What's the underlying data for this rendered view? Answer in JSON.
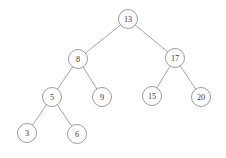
{
  "figure": {
    "background_color": "#ffffff",
    "node_stroke_color": "#8a8a8a",
    "node_fill_color": "#ffffff",
    "edge_color": "#8e8e8e",
    "label_color": "#3a3a3a",
    "node_radius": 9.5,
    "caption_ghost": ""
  },
  "chart_data": {
    "type": "diagram",
    "diagram_type": "binary-search-tree",
    "xlabel": "",
    "ylabel": "",
    "root": "n13",
    "depth": 4,
    "node_count": 9,
    "edge_count": 8,
    "traversal_inorder": [
      3,
      5,
      6,
      8,
      9,
      13,
      15,
      17,
      20
    ],
    "values": [
      13,
      8,
      17,
      5,
      9,
      15,
      20,
      3,
      6
    ],
    "nodes": [
      {
        "id": "n13",
        "label": "13",
        "value": 13,
        "x": 128,
        "y": 19,
        "level": 0,
        "parent": null,
        "side": "root"
      },
      {
        "id": "n8",
        "label": "8",
        "value": 8,
        "x": 78,
        "y": 59,
        "level": 1,
        "parent": "n13",
        "side": "left"
      },
      {
        "id": "n17",
        "label": "17",
        "value": 17,
        "x": 175,
        "y": 58,
        "level": 1,
        "parent": "n13",
        "side": "right"
      },
      {
        "id": "n5",
        "label": "5",
        "value": 5,
        "x": 52,
        "y": 97,
        "level": 2,
        "parent": "n8",
        "side": "left"
      },
      {
        "id": "n9",
        "label": "9",
        "value": 9,
        "x": 102,
        "y": 97,
        "level": 2,
        "parent": "n8",
        "side": "right"
      },
      {
        "id": "n15",
        "label": "15",
        "value": 15,
        "x": 152,
        "y": 96,
        "level": 2,
        "parent": "n17",
        "side": "left"
      },
      {
        "id": "n20",
        "label": "20",
        "value": 20,
        "x": 201,
        "y": 97,
        "level": 2,
        "parent": "n17",
        "side": "right"
      },
      {
        "id": "n3",
        "label": "3",
        "value": 3,
        "x": 27,
        "y": 133,
        "level": 3,
        "parent": "n5",
        "side": "left"
      },
      {
        "id": "n6",
        "label": "6",
        "value": 6,
        "x": 77,
        "y": 134,
        "level": 3,
        "parent": "n5",
        "side": "right"
      }
    ],
    "edges": [
      {
        "from": "n13",
        "to": "n8"
      },
      {
        "from": "n13",
        "to": "n17"
      },
      {
        "from": "n8",
        "to": "n5"
      },
      {
        "from": "n8",
        "to": "n9"
      },
      {
        "from": "n17",
        "to": "n15"
      },
      {
        "from": "n17",
        "to": "n20"
      },
      {
        "from": "n5",
        "to": "n3"
      },
      {
        "from": "n5",
        "to": "n6"
      }
    ]
  }
}
